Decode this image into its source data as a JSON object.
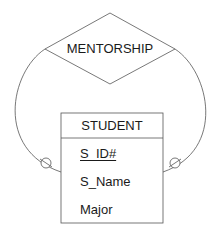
{
  "diagram": {
    "type": "er-diagram",
    "relationship": {
      "label": "MENTORSHIP",
      "shape": "diamond"
    },
    "entity": {
      "title": "STUDENT",
      "attributes": [
        {
          "name": "S_ID#",
          "primary_key": true
        },
        {
          "name": "S_Name",
          "primary_key": false
        },
        {
          "name": "Major",
          "primary_key": false
        }
      ]
    },
    "connectors": [
      {
        "from": "MENTORSHIP",
        "to": "STUDENT",
        "side": "left",
        "cardinality": "optional (circle)"
      },
      {
        "from": "MENTORSHIP",
        "to": "STUDENT",
        "side": "right",
        "cardinality": "optional (circle)"
      }
    ],
    "colors": {
      "line": "#555555",
      "text": "#1a1a1a",
      "background": "#ffffff"
    }
  }
}
